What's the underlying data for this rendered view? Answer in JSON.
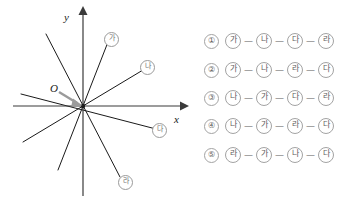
{
  "figure": {
    "origin_label": "O",
    "x_axis_label": "x",
    "y_axis_label": "y",
    "line_markers": [
      {
        "id": "ga",
        "label": "가"
      },
      {
        "id": "na",
        "label": "나"
      },
      {
        "id": "da",
        "label": "다"
      },
      {
        "id": "ra",
        "label": "라"
      }
    ]
  },
  "choices": [
    {
      "number": "①",
      "items": [
        "가",
        "나",
        "다",
        "라"
      ],
      "separators": [
        "—",
        "—",
        "—"
      ]
    },
    {
      "number": "②",
      "items": [
        "가",
        "나",
        "라",
        "다"
      ],
      "separators": [
        "—",
        "—",
        "—"
      ]
    },
    {
      "number": "③",
      "items": [
        "나",
        "가",
        "다",
        "라"
      ],
      "separators": [
        "—",
        "—",
        "—"
      ]
    },
    {
      "number": "④",
      "items": [
        "나",
        "가",
        "라",
        "다"
      ],
      "separators": [
        "—",
        "—",
        "—"
      ]
    },
    {
      "number": "⑤",
      "items": [
        "라",
        "가",
        "나",
        "다"
      ],
      "separators": [
        "—",
        "—",
        "—"
      ]
    }
  ],
  "colors": {
    "line": "#1a1a1a",
    "axis": "#3a3a3a",
    "marker_border": "#9a9a9a",
    "marker_text": "#6f6f6f",
    "leader_arrow": "#9b9b9b",
    "background": "#ffffff"
  }
}
